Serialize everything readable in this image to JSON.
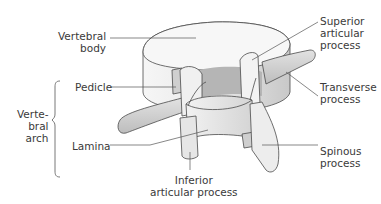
{
  "figure": {
    "labels": {
      "vertebral_body": [
        "Vertebral",
        "body"
      ],
      "pedicle": [
        "Pedicle"
      ],
      "vertebral_arch": [
        "Verte-",
        "bral",
        "arch"
      ],
      "lamina": [
        "Lamina"
      ],
      "inferior_articular_process": [
        "Inferior",
        "articular process"
      ],
      "superior_articular_process": [
        "Superior",
        "articular",
        "process"
      ],
      "transverse_process": [
        "Transverse",
        "process"
      ],
      "spinous_process": [
        "Spinous",
        "process"
      ]
    },
    "colors": {
      "text": "#3a3a3a",
      "leader_line": "#555555",
      "outline": "#4a4a4a",
      "surface_light": "#f4f4f4",
      "surface_mid": "#d9d9d9",
      "surface_dark": "#b8b8b8",
      "background": "#ffffff"
    }
  }
}
